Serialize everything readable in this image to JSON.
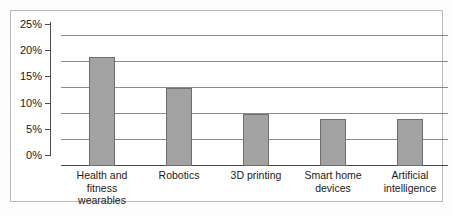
{
  "chart_data": {
    "type": "bar",
    "title": "",
    "subtitle": "",
    "xlabel": "",
    "ylabel": "",
    "categories": [
      "Health and fitness wearables",
      "Robotics",
      "3D printing",
      "Smart home devices",
      "Artificial intelligence"
    ],
    "category_lines": [
      [
        "Health and",
        "fitness",
        "wearables"
      ],
      [
        "Robotics"
      ],
      [
        "3D printing"
      ],
      [
        "Smart home",
        "devices"
      ],
      [
        "Artificial",
        "intelligence"
      ]
    ],
    "values": [
      21,
      15,
      10,
      9,
      9
    ],
    "value_labels": [
      "21%",
      "15%",
      "10%",
      "9%",
      "9%"
    ],
    "ylim": [
      0,
      25
    ],
    "ytick_values": [
      25,
      20,
      15,
      10,
      5,
      0
    ],
    "ytick_labels": [
      "25%",
      "20%",
      "15%",
      "10%",
      "5%",
      "0%"
    ],
    "grid": true,
    "legend": false,
    "legend_position": "none",
    "series": [
      {
        "name": "Share of respondents",
        "values": [
          21,
          15,
          10,
          9,
          9
        ]
      }
    ]
  },
  "style": {
    "bar_fill": "#a2a2a2",
    "bar_stroke": "#6e6e6e",
    "gridline_color": "#8c8c8c",
    "axis_color": "#4a4a4a",
    "frame_border": "#b9b9b9",
    "background": "#ffffff",
    "text_color": "#1a1a1a"
  }
}
